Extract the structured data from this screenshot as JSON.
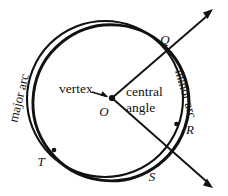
{
  "figure": {
    "stroke_color": "#111111",
    "background_color": "#ffffff",
    "circle": {
      "cx": 105,
      "cy": 99,
      "r": 78
    },
    "center_point": {
      "x": 112,
      "y": 98
    },
    "labels": {
      "center": "O",
      "arc_endpoint_top": "Q",
      "arc_point_right": "R",
      "arc_endpoint_bottom": "S",
      "arc_point_left": "T",
      "vertex": "vertex",
      "central_angle_line1": "central",
      "central_angle_line2": "angle",
      "minor_arc": "minor arc",
      "major_arc": "major arc"
    },
    "rays": [
      {
        "name": "ray-OQ",
        "from": "O",
        "through": "Q",
        "arrow_tip": {
          "x": 213,
          "y": 9
        }
      },
      {
        "name": "ray-OS",
        "from": "O",
        "through": "S",
        "arrow_tip": {
          "x": 213,
          "y": 188
        }
      }
    ],
    "marked_points": [
      {
        "label": "Q",
        "x": 171,
        "y": 53
      },
      {
        "label": "R",
        "x": 176,
        "y": 125
      },
      {
        "label": "S",
        "x": 158,
        "y": 165
      },
      {
        "label": "T",
        "x": 53,
        "y": 151
      }
    ]
  }
}
